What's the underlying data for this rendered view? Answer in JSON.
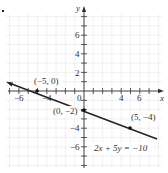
{
  "figure": {
    "label_marker": ".",
    "equation": "2x + 5y = −10"
  },
  "chart_data": {
    "type": "line",
    "title": "",
    "xlabel": "x",
    "ylabel": "y",
    "xlim": [
      -7.5,
      7.5
    ],
    "ylim": [
      -7,
      8
    ],
    "grid": true,
    "x_ticks": [
      -6,
      -4,
      0,
      4,
      6
    ],
    "x_tick_labels": [
      "−6",
      "−4",
      "0",
      "4",
      "6"
    ],
    "y_ticks": [
      6,
      4,
      2,
      -4,
      -6
    ],
    "y_tick_labels": [
      "6",
      "4",
      "2",
      "−4",
      "−6"
    ],
    "series": [
      {
        "name": "2x + 5y = −10",
        "equation": "2x + 5y = −10",
        "slope": -0.4,
        "intercept": -2,
        "x": [
          -7.2,
          7.5
        ],
        "y": [
          0.88,
          -5.0
        ]
      }
    ],
    "points": [
      {
        "x": -5,
        "y": 0,
        "label": "(−5, 0)"
      },
      {
        "x": 0,
        "y": -2,
        "label": "(0, −2)"
      },
      {
        "x": 5,
        "y": -4,
        "label": "(5, −4)"
      }
    ],
    "annotations": [
      {
        "text": "2x + 5y = −10",
        "x": 3.5,
        "y": -6
      }
    ]
  }
}
